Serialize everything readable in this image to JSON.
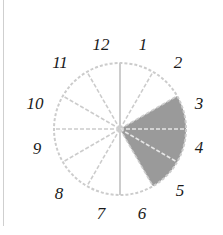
{
  "diagram": {
    "type": "clock-fraction",
    "center": [
      120,
      129
    ],
    "radius": 66,
    "divisions": 12,
    "shaded_sector": {
      "from_deg": 60,
      "to_deg": 150,
      "color": "#9a9a9a"
    },
    "line_color": "#cccccc",
    "labels": [
      {
        "text": "12",
        "x": 101,
        "y": 50
      },
      {
        "text": "1",
        "x": 143,
        "y": 50
      },
      {
        "text": "2",
        "x": 178,
        "y": 68
      },
      {
        "text": "3",
        "x": 199,
        "y": 109
      },
      {
        "text": "4",
        "x": 199,
        "y": 153
      },
      {
        "text": "5",
        "x": 180,
        "y": 196
      },
      {
        "text": "6",
        "x": 142,
        "y": 219
      },
      {
        "text": "7",
        "x": 101,
        "y": 219
      },
      {
        "text": "8",
        "x": 59,
        "y": 199
      },
      {
        "text": "9",
        "x": 37,
        "y": 154
      },
      {
        "text": "10",
        "x": 35,
        "y": 109
      },
      {
        "text": "11",
        "x": 60,
        "y": 68
      }
    ]
  }
}
